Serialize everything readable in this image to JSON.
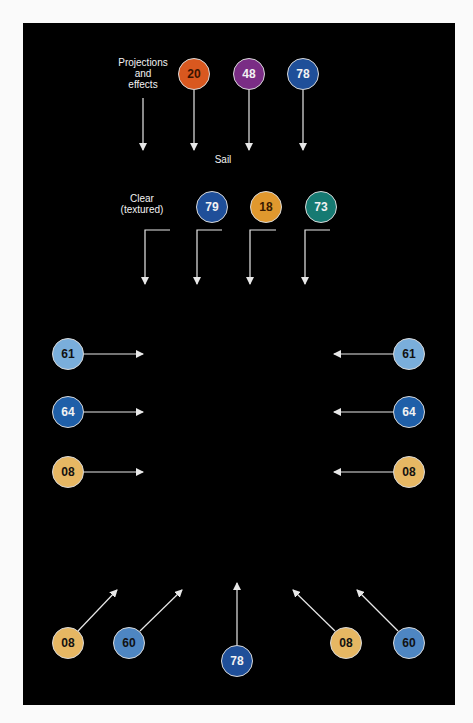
{
  "labels": {
    "projections": "Projections and effects",
    "projections_lines": [
      "Projections",
      "and",
      "effects"
    ],
    "sail": "Sail",
    "clear_lines": [
      "Clear",
      "(textured)"
    ]
  },
  "colors": {
    "orange_red": "#d9581f",
    "purple": "#7a2d85",
    "dark_blue": "#1f4f99",
    "amber": "#e0982e",
    "teal": "#167a72",
    "light_blue": "#7aaedb",
    "mid_blue": "#1f5fa8",
    "tan": "#e6b763",
    "steel_blue": "#4e86c2"
  },
  "badges": [
    {
      "id": "top-20",
      "text": "20",
      "x": 194,
      "y": 74,
      "bg": "#d9581f",
      "fg": "#3a1300"
    },
    {
      "id": "top-48",
      "text": "48",
      "x": 249,
      "y": 74,
      "bg": "#7a2d85",
      "fg": "#f2f2f2"
    },
    {
      "id": "top-78",
      "text": "78",
      "x": 303,
      "y": 74,
      "bg": "#1f4f99",
      "fg": "#f2f2f2"
    },
    {
      "id": "mid-79",
      "text": "79",
      "x": 212,
      "y": 207,
      "bg": "#1f4f99",
      "fg": "#f2f2f2"
    },
    {
      "id": "mid-18",
      "text": "18",
      "x": 266,
      "y": 207,
      "bg": "#e0982e",
      "fg": "#3a1a00"
    },
    {
      "id": "mid-73",
      "text": "73",
      "x": 321,
      "y": 207,
      "bg": "#167a72",
      "fg": "#f2f2f2"
    },
    {
      "id": "left-61",
      "text": "61",
      "x": 68,
      "y": 354,
      "bg": "#7aaedb",
      "fg": "#111"
    },
    {
      "id": "left-64",
      "text": "64",
      "x": 68,
      "y": 412,
      "bg": "#1f5fa8",
      "fg": "#f2f2f2"
    },
    {
      "id": "left-08",
      "text": "08",
      "x": 68,
      "y": 472,
      "bg": "#e6b763",
      "fg": "#111"
    },
    {
      "id": "right-61",
      "text": "61",
      "x": 409,
      "y": 354,
      "bg": "#7aaedb",
      "fg": "#111"
    },
    {
      "id": "right-64",
      "text": "64",
      "x": 409,
      "y": 412,
      "bg": "#1f5fa8",
      "fg": "#f2f2f2"
    },
    {
      "id": "right-08",
      "text": "08",
      "x": 409,
      "y": 472,
      "bg": "#e6b763",
      "fg": "#111"
    },
    {
      "id": "bottom-08-left",
      "text": "08",
      "x": 68,
      "y": 643,
      "bg": "#e6b763",
      "fg": "#111"
    },
    {
      "id": "bottom-60-left",
      "text": "60",
      "x": 129,
      "y": 643,
      "bg": "#4e86c2",
      "fg": "#111"
    },
    {
      "id": "bottom-78",
      "text": "78",
      "x": 237,
      "y": 661,
      "bg": "#1f4f99",
      "fg": "#f2f2f2"
    },
    {
      "id": "bottom-08-right",
      "text": "08",
      "x": 346,
      "y": 643,
      "bg": "#e6b763",
      "fg": "#111"
    },
    {
      "id": "bottom-60-right",
      "text": "60",
      "x": 409,
      "y": 643,
      "bg": "#4e86c2",
      "fg": "#111"
    }
  ],
  "arrows": [
    {
      "id": "proj",
      "pts": [
        [
          143,
          98
        ],
        [
          143,
          150
        ]
      ]
    },
    {
      "id": "a20",
      "pts": [
        [
          194,
          90
        ],
        [
          194,
          150
        ]
      ]
    },
    {
      "id": "a48",
      "pts": [
        [
          249,
          90
        ],
        [
          249,
          150
        ]
      ]
    },
    {
      "id": "a78",
      "pts": [
        [
          303,
          90
        ],
        [
          303,
          150
        ]
      ]
    },
    {
      "id": "clear",
      "pts": [
        [
          170,
          230
        ],
        [
          145,
          230
        ],
        [
          145,
          284
        ]
      ]
    },
    {
      "id": "a79",
      "pts": [
        [
          222,
          230
        ],
        [
          197,
          230
        ],
        [
          197,
          284
        ]
      ]
    },
    {
      "id": "a18",
      "pts": [
        [
          276,
          230
        ],
        [
          250,
          230
        ],
        [
          250,
          284
        ]
      ]
    },
    {
      "id": "a73",
      "pts": [
        [
          330,
          230
        ],
        [
          305,
          230
        ],
        [
          305,
          284
        ]
      ]
    },
    {
      "id": "l61",
      "pts": [
        [
          84,
          354
        ],
        [
          143,
          354
        ]
      ]
    },
    {
      "id": "l64",
      "pts": [
        [
          84,
          412
        ],
        [
          143,
          412
        ]
      ]
    },
    {
      "id": "l08",
      "pts": [
        [
          84,
          472
        ],
        [
          143,
          472
        ]
      ]
    },
    {
      "id": "r61",
      "pts": [
        [
          393,
          354
        ],
        [
          334,
          354
        ]
      ]
    },
    {
      "id": "r64",
      "pts": [
        [
          393,
          412
        ],
        [
          334,
          412
        ]
      ]
    },
    {
      "id": "r08",
      "pts": [
        [
          393,
          472
        ],
        [
          334,
          472
        ]
      ]
    },
    {
      "id": "b08l",
      "pts": [
        [
          78,
          631
        ],
        [
          117,
          590
        ]
      ]
    },
    {
      "id": "b60l",
      "pts": [
        [
          140,
          631
        ],
        [
          182,
          590
        ]
      ]
    },
    {
      "id": "b78",
      "pts": [
        [
          237,
          645
        ],
        [
          237,
          583
        ]
      ]
    },
    {
      "id": "b08r",
      "pts": [
        [
          335,
          631
        ],
        [
          293,
          590
        ]
      ]
    },
    {
      "id": "b60r",
      "pts": [
        [
          398,
          631
        ],
        [
          357,
          590
        ]
      ]
    }
  ]
}
